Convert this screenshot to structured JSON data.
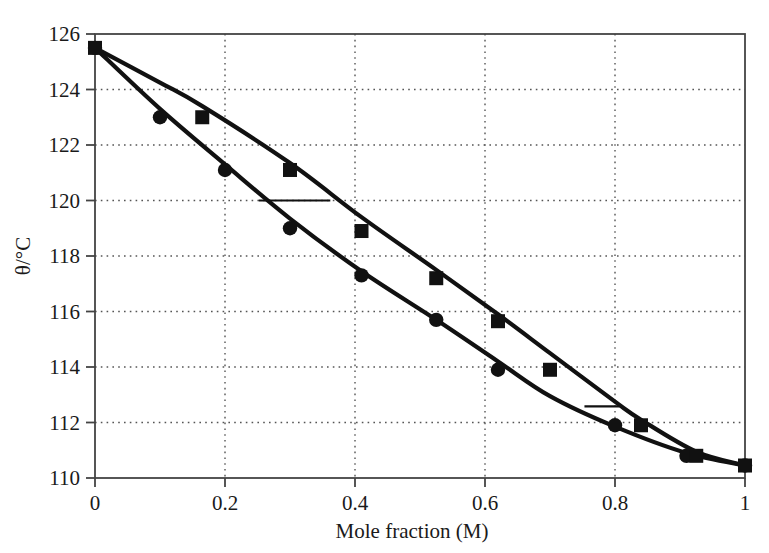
{
  "chart_data": {
    "type": "line",
    "title": "",
    "subtitle": "",
    "xlabel": "Mole fraction (M)",
    "ylabel": "θ/°C",
    "xlim": [
      0,
      1
    ],
    "ylim": [
      110,
      126
    ],
    "xticks": [
      0,
      0.2,
      0.4,
      0.6,
      0.8,
      1
    ],
    "xticklabels": [
      "0",
      "0.2",
      "0.4",
      "0.6",
      "0.8",
      "1"
    ],
    "yticks": [
      110,
      112,
      114,
      116,
      118,
      120,
      122,
      124,
      126
    ],
    "yticklabels": [
      "110",
      "112",
      "114",
      "116",
      "118",
      "120",
      "122",
      "124",
      "126"
    ],
    "grid": "dotted",
    "legend": "none",
    "marker_color": "#111111",
    "line_color": "#111111",
    "grid_color": "#555555",
    "frame_color": "#444444",
    "series": [
      {
        "name": "liquidus",
        "marker": "circle",
        "x": [
          0.0,
          0.1,
          0.2,
          0.3,
          0.41,
          0.525,
          0.62,
          0.8,
          0.91,
          1.0
        ],
        "y": [
          125.5,
          123.0,
          121.1,
          119.0,
          117.3,
          115.7,
          113.9,
          111.9,
          110.8,
          110.45
        ]
      },
      {
        "name": "vapour",
        "marker": "square",
        "x": [
          0.0,
          0.165,
          0.3,
          0.41,
          0.525,
          0.62,
          0.7,
          0.84,
          0.925,
          1.0
        ],
        "y": [
          125.5,
          123.0,
          121.1,
          118.9,
          117.2,
          115.65,
          113.9,
          111.9,
          110.8,
          110.45
        ]
      }
    ],
    "curves": [
      {
        "name": "upper-curve",
        "points": [
          [
            0.0,
            125.5
          ],
          [
            0.1,
            124.25
          ],
          [
            0.165,
            123.4
          ],
          [
            0.3,
            121.35
          ],
          [
            0.41,
            119.4
          ],
          [
            0.525,
            117.5
          ],
          [
            0.62,
            115.9
          ],
          [
            0.7,
            114.5
          ],
          [
            0.8,
            112.75
          ],
          [
            0.84,
            112.1
          ],
          [
            0.925,
            110.95
          ],
          [
            1.0,
            110.45
          ]
        ]
      },
      {
        "name": "lower-curve",
        "points": [
          [
            0.0,
            125.5
          ],
          [
            0.1,
            123.3
          ],
          [
            0.2,
            121.3
          ],
          [
            0.3,
            119.35
          ],
          [
            0.41,
            117.45
          ],
          [
            0.525,
            115.7
          ],
          [
            0.62,
            114.2
          ],
          [
            0.7,
            112.95
          ],
          [
            0.8,
            111.85
          ],
          [
            0.91,
            110.9
          ],
          [
            1.0,
            110.45
          ]
        ]
      }
    ],
    "tie_lines": [
      {
        "name": "tie-line-upper",
        "y": 120.0,
        "x_start": 0.252,
        "x_end": 0.362
      },
      {
        "name": "tie-line-lower",
        "y": 112.58,
        "x_start": 0.753,
        "x_end": 0.807
      }
    ]
  }
}
